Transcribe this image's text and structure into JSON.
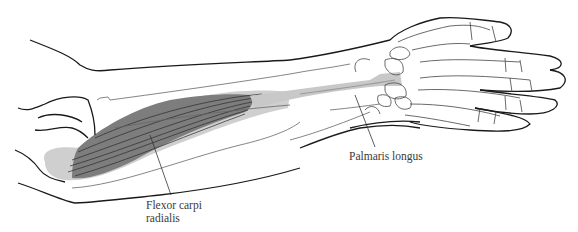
{
  "figure": {
    "colors": {
      "outline": "#1a1a1a",
      "bone_line": "#555555",
      "muscle_dark": "#7d7d7d",
      "muscle_light": "#cfcfcf",
      "tendon": "#c8c8c8",
      "label_text": "#3a3a3a"
    }
  },
  "labels": {
    "flexor_carpi_radialis": "Flexor carpi\nradialis",
    "palmaris_longus": "Palmaris longus"
  }
}
